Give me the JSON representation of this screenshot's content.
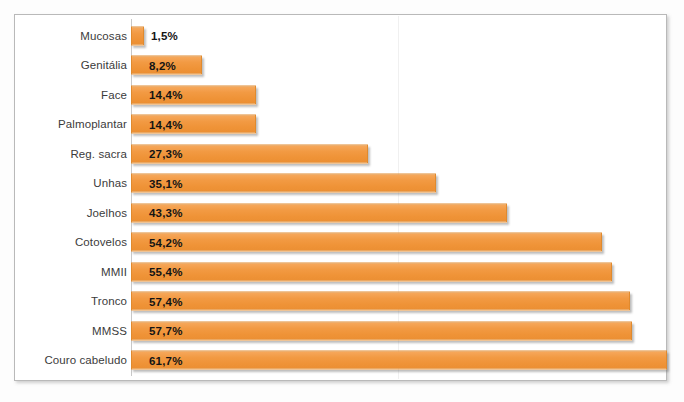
{
  "chart_data": {
    "type": "bar",
    "orientation": "horizontal",
    "title": "",
    "subtitle": "",
    "xlabel": "",
    "ylabel": "",
    "xlim": [
      0,
      61.7
    ],
    "grid": false,
    "legend": null,
    "value_suffix": "%",
    "decimal_separator": ",",
    "categories": [
      "Mucosas",
      "Genitália",
      "Face",
      "Palmoplantar",
      "Reg. sacra",
      "Unhas",
      "Joelhos",
      "Cotovelos",
      "MMII",
      "Tronco",
      "MMSS",
      "Couro cabeludo"
    ],
    "values": [
      1.5,
      8.2,
      14.4,
      14.4,
      27.3,
      35.1,
      43.3,
      54.2,
      55.4,
      57.4,
      57.7,
      61.7
    ],
    "value_labels": [
      "1,5%",
      "8,2%",
      "14,4%",
      "14,4%",
      "27,3%",
      "35,1%",
      "43,3%",
      "54,2%",
      "55,4%",
      "57,4%",
      "57,7%",
      "61,7%"
    ],
    "colors": {
      "bar_fill": "#F29A43",
      "bar_edge": "#E08A2E",
      "label_text": "#3B3B3B",
      "value_text": "#141414",
      "frame_border": "#B9B9B9",
      "plot_background": "#FFFFFF",
      "gridline": "#F0F0F0"
    }
  }
}
